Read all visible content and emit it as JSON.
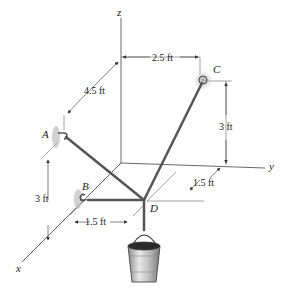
{
  "diagram": {
    "type": "3d-statics-cable-system",
    "axes": {
      "x": "x",
      "y": "y",
      "z": "z"
    },
    "points": {
      "A": "A",
      "B": "B",
      "C": "C",
      "D": "D"
    },
    "dimensions": {
      "OA_along_x": "4.5 ft",
      "C_along_y": "2.5 ft",
      "C_height": "3 ft",
      "D_offset_y": "1.5 ft",
      "A_above_B": "3 ft",
      "B_to_D": "1.5 ft"
    },
    "load": "bucket"
  }
}
